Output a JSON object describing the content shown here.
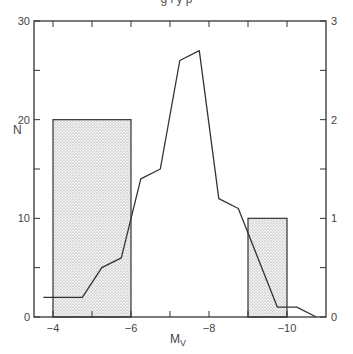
{
  "header": {
    "partial_title": "g l   y p"
  },
  "chart_data": {
    "type": "bar+line",
    "title": "",
    "xlabel": "M_V",
    "xlabel_main": "M",
    "xlabel_sub": "V",
    "ylabel_left": "N",
    "ylabel_right": "",
    "xlim": [
      -3.5,
      -11
    ],
    "ylim_left": [
      0,
      30
    ],
    "ylim_right": [
      0,
      3
    ],
    "x_ticks": [
      -4,
      -5,
      -6,
      -7,
      -8,
      -9,
      -10
    ],
    "x_tick_labels": [
      "-4",
      "-6",
      "-8",
      "-10"
    ],
    "x_tick_label_values": [
      -4,
      -6,
      -8,
      -10
    ],
    "y_left_tick_labels": [
      "0",
      "10",
      "20",
      "30"
    ],
    "y_left_tick_values": [
      0,
      10,
      20,
      30
    ],
    "y_left_minor_ticks": [
      5,
      15,
      25
    ],
    "y_right_tick_labels": [
      "0",
      "1",
      "2",
      "3"
    ],
    "y_right_tick_values": [
      0,
      1,
      2,
      3
    ],
    "y_right_minor_ticks": [
      0.5,
      1.5,
      2.5
    ],
    "grid": false,
    "bars": {
      "name": "Shaded histogram (right axis)",
      "axis": "right",
      "pattern": "dotted",
      "bins": [
        {
          "x_from": -4,
          "x_to": -6,
          "value": 2
        },
        {
          "x_from": -9,
          "x_to": -10,
          "value": 1
        }
      ]
    },
    "line": {
      "name": "Luminosity function N (left axis)",
      "axis": "left",
      "x": [
        -3.75,
        -4.75,
        -5.25,
        -5.75,
        -6.25,
        -6.75,
        -7.25,
        -7.75,
        -8.25,
        -8.75,
        -9.75,
        -10.25,
        -10.75
      ],
      "y": [
        2,
        2,
        5,
        6,
        14,
        15,
        26,
        27,
        12,
        11,
        1,
        1,
        0
      ]
    }
  }
}
